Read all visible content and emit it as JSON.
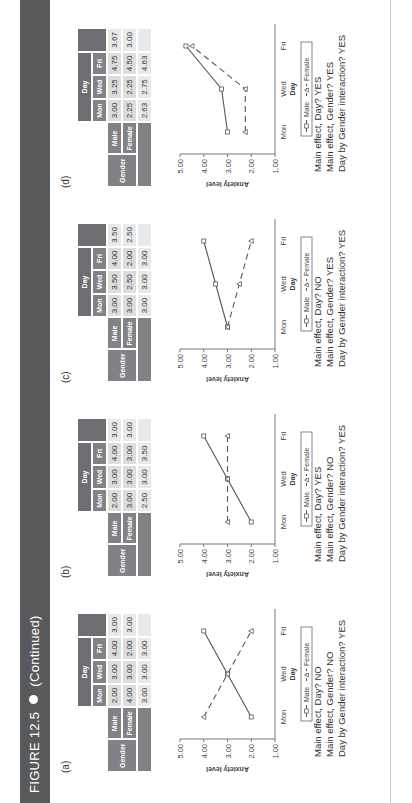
{
  "header": {
    "figure": "FIGURE 12.5",
    "note": "(Continued)",
    "bar_color": "#58595b"
  },
  "labels": {
    "gender": "Gender",
    "day": "Day",
    "male": "Male",
    "female": "Female",
    "legend_male": "Male",
    "legend_female": "Female",
    "ylabel": "Anxiety level",
    "xlabel": "Day",
    "days": [
      "Mon",
      "Wed",
      "Fri"
    ],
    "yticks": [
      "5.00",
      "4.00",
      "3.00",
      "2.00",
      "1.00"
    ]
  },
  "panels": [
    {
      "label": "(a)",
      "male": [
        "2.00",
        "3.00",
        "4.00"
      ],
      "male_mean": "3.00",
      "female": [
        "4.00",
        "3.00",
        "2.00"
      ],
      "female_mean": "3.00",
      "col_means": [
        "3.00",
        "3.00",
        "3.00"
      ],
      "effects": [
        "Main effect, Day? NO",
        "Main effect, Gender? NO",
        "Day by Gender interaction? YES"
      ]
    },
    {
      "label": "(b)",
      "male": [
        "2.00",
        "3.00",
        "4.00"
      ],
      "male_mean": "3.00",
      "female": [
        "3.00",
        "3.00",
        "3.00"
      ],
      "female_mean": "3.00",
      "col_means": [
        "2.50",
        "3.00",
        "3.50"
      ],
      "effects": [
        "Main effect, Day? YES",
        "Main effect, Gender? NO",
        "Day by Gender interaction? YES"
      ]
    },
    {
      "label": "(c)",
      "male": [
        "3.00",
        "3.50",
        "4.00"
      ],
      "male_mean": "3.50",
      "female": [
        "3.00",
        "2.50",
        "2.00"
      ],
      "female_mean": "2.50",
      "col_means": [
        "3.00",
        "3.00",
        "3.00"
      ],
      "effects": [
        "Main effect, Day? NO",
        "Main effect, Gender? YES",
        "Day by Gender interaction? YES"
      ]
    },
    {
      "label": "(d)",
      "male": [
        "3.00",
        "3.25",
        "4.75"
      ],
      "male_mean": "3.67",
      "female": [
        "2.25",
        "2.25",
        "4.50"
      ],
      "female_mean": "3.00",
      "col_means": [
        "2.63",
        "2.75",
        "4.63"
      ],
      "effects": [
        "Main effect, Day? YES",
        "Main effect, Gender? YES",
        "Day by Gender interaction? YES"
      ]
    }
  ],
  "chart_data": [
    {
      "type": "line",
      "title": "(a)",
      "categories": [
        "Mon",
        "Wed",
        "Fri"
      ],
      "xlabel": "Day",
      "ylabel": "Anxiety level",
      "ylim": [
        1,
        5
      ],
      "series": [
        {
          "name": "Male",
          "values": [
            2.0,
            3.0,
            4.0
          ]
        },
        {
          "name": "Female",
          "values": [
            4.0,
            3.0,
            2.0
          ]
        }
      ]
    },
    {
      "type": "line",
      "title": "(b)",
      "categories": [
        "Mon",
        "Wed",
        "Fri"
      ],
      "xlabel": "Day",
      "ylabel": "Anxiety level",
      "ylim": [
        1,
        5
      ],
      "series": [
        {
          "name": "Male",
          "values": [
            2.0,
            3.0,
            4.0
          ]
        },
        {
          "name": "Female",
          "values": [
            3.0,
            3.0,
            3.0
          ]
        }
      ]
    },
    {
      "type": "line",
      "title": "(c)",
      "categories": [
        "Mon",
        "Wed",
        "Fri"
      ],
      "xlabel": "Day",
      "ylabel": "Anxiety level",
      "ylim": [
        1,
        5
      ],
      "series": [
        {
          "name": "Male",
          "values": [
            3.0,
            3.5,
            4.0
          ]
        },
        {
          "name": "Female",
          "values": [
            3.0,
            2.5,
            2.0
          ]
        }
      ]
    },
    {
      "type": "line",
      "title": "(d)",
      "categories": [
        "Mon",
        "Wed",
        "Fri"
      ],
      "xlabel": "Day",
      "ylabel": "Anxiety level",
      "ylim": [
        1,
        5
      ],
      "series": [
        {
          "name": "Male",
          "values": [
            3.0,
            3.25,
            4.75
          ]
        },
        {
          "name": "Female",
          "values": [
            2.25,
            2.25,
            4.5
          ]
        }
      ]
    }
  ]
}
